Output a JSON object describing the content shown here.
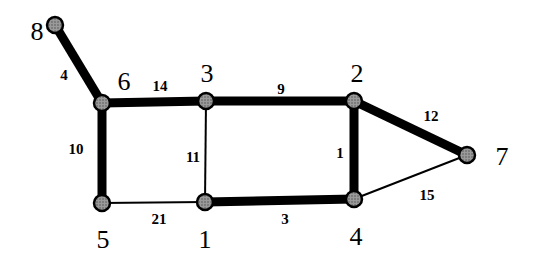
{
  "diagram": {
    "type": "weighted-graph",
    "nodes": [
      {
        "id": "1",
        "x": 205,
        "y": 202,
        "label_x": 205,
        "label_y": 248
      },
      {
        "id": "2",
        "x": 354,
        "y": 101,
        "label_x": 357,
        "label_y": 82
      },
      {
        "id": "3",
        "x": 206,
        "y": 101,
        "label_x": 207,
        "label_y": 82
      },
      {
        "id": "4",
        "x": 354,
        "y": 199,
        "label_x": 356,
        "label_y": 245
      },
      {
        "id": "5",
        "x": 102,
        "y": 203,
        "label_x": 103,
        "label_y": 248
      },
      {
        "id": "6",
        "x": 102,
        "y": 103,
        "label_x": 124,
        "label_y": 90
      },
      {
        "id": "7",
        "x": 467,
        "y": 155,
        "label_x": 502,
        "label_y": 165
      },
      {
        "id": "8",
        "x": 55,
        "y": 25,
        "label_x": 37,
        "label_y": 40
      }
    ],
    "edges": [
      {
        "from": "8",
        "to": "6",
        "weight": "4",
        "thick": true,
        "label_x": 64,
        "label_y": 80
      },
      {
        "from": "6",
        "to": "3",
        "weight": "14",
        "thick": true,
        "label_x": 160,
        "label_y": 91
      },
      {
        "from": "3",
        "to": "2",
        "weight": "9",
        "thick": true,
        "label_x": 281,
        "label_y": 94
      },
      {
        "from": "2",
        "to": "7",
        "weight": "12",
        "thick": true,
        "label_x": 431,
        "label_y": 121
      },
      {
        "from": "6",
        "to": "5",
        "weight": "10",
        "thick": true,
        "label_x": 76,
        "label_y": 154
      },
      {
        "from": "3",
        "to": "1",
        "weight": "11",
        "thick": false,
        "label_x": 193,
        "label_y": 162
      },
      {
        "from": "2",
        "to": "4",
        "weight": "1",
        "thick": true,
        "label_x": 340,
        "label_y": 158
      },
      {
        "from": "5",
        "to": "1",
        "weight": "21",
        "thick": false,
        "label_x": 159,
        "label_y": 224
      },
      {
        "from": "1",
        "to": "4",
        "weight": "3",
        "thick": true,
        "label_x": 285,
        "label_y": 224
      },
      {
        "from": "4",
        "to": "7",
        "weight": "15",
        "thick": false,
        "label_x": 427,
        "label_y": 200
      }
    ]
  }
}
